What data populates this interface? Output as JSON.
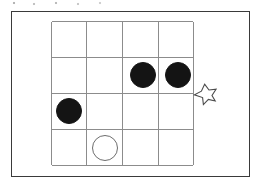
{
  "figure": {
    "width": 262,
    "height": 188,
    "background_color": "#ffffff"
  },
  "outer_frame": {
    "name": "outer-frame",
    "x": 11,
    "y": 11,
    "width": 239,
    "height": 166,
    "border_color": "#3a3a3a",
    "border_width": 1.4
  },
  "board": {
    "name": "board-grid",
    "x": 51,
    "y": 21,
    "width": 143,
    "height": 145,
    "rows": 4,
    "columns": 4,
    "cell_width": 35.75,
    "cell_height": 36.25,
    "line_color": "#8c8c8c",
    "line_width": 1.1,
    "vertical_line_x": [
      0,
      35.75,
      71.5,
      107.25,
      143
    ],
    "horizontal_line_y": [
      0,
      36.25,
      72.5,
      108.75,
      145
    ]
  },
  "stones": [
    {
      "name": "stone-black-r2c3",
      "color": "black",
      "fill": "#141414",
      "row": 2,
      "column": 3,
      "center_x": 143,
      "center_y": 75,
      "diameter": 26
    },
    {
      "name": "stone-black-r2c4",
      "color": "black",
      "fill": "#141414",
      "row": 2,
      "column": 4,
      "center_x": 178,
      "center_y": 75,
      "diameter": 26
    },
    {
      "name": "stone-black-r3c1",
      "color": "black",
      "fill": "#141414",
      "row": 3,
      "column": 1,
      "center_x": 69,
      "center_y": 111,
      "diameter": 26
    },
    {
      "name": "stone-white-r4c2",
      "color": "white",
      "fill": "#ffffff",
      "stroke": "#6d6d6d",
      "row": 4,
      "column": 2,
      "center_x": 105,
      "center_y": 148,
      "diameter": 26
    }
  ],
  "marker": {
    "name": "star-marker",
    "shape": "star-5-point",
    "x": 193,
    "y": 83,
    "width": 24,
    "height": 23,
    "fill": "#ffffff",
    "stroke": "#4a4a4a",
    "stroke_width": 1.1,
    "points": 5
  }
}
